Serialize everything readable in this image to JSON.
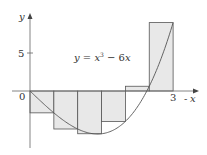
{
  "chart_data": {
    "type": "bar",
    "title": "",
    "equation_label": "y = x³ − 6x",
    "function": "x^3 - 6x",
    "method": "right-endpoint Riemann sum",
    "interval": [
      0,
      3
    ],
    "n": 6,
    "dx": 0.5,
    "categories": [
      "[0,0.5]",
      "[0.5,1]",
      "[1,1.5]",
      "[1.5,2]",
      "[2,2.5]",
      "[2.5,3]"
    ],
    "x_left": [
      0,
      0.5,
      1,
      1.5,
      2,
      2.5
    ],
    "values": [
      -2.875,
      -5,
      -5.625,
      -4,
      0.625,
      9
    ],
    "xlabel": "x",
    "ylabel": "y",
    "x_ticks": [
      {
        "value": 0,
        "label": "0"
      },
      {
        "value": 3,
        "label": "3"
      }
    ],
    "y_ticks": [
      {
        "value": 5,
        "label": "5"
      }
    ],
    "xlim": [
      0,
      3.4
    ],
    "ylim": [
      -7,
      11
    ],
    "grid": false,
    "legend": "none",
    "colors": {
      "fill": "#e8e8e8",
      "stroke": "#555555",
      "curve": "#555555",
      "axis": "#666666"
    }
  },
  "labels": {
    "y_axis": "y",
    "x_axis": "x",
    "origin": "0",
    "x_tick_3": "3",
    "y_tick_5": "5",
    "eq_y": "y",
    "eq_eq": " = ",
    "eq_x": "x",
    "eq_exp": "3",
    "eq_rest": " − 6",
    "eq_x2": "x"
  }
}
